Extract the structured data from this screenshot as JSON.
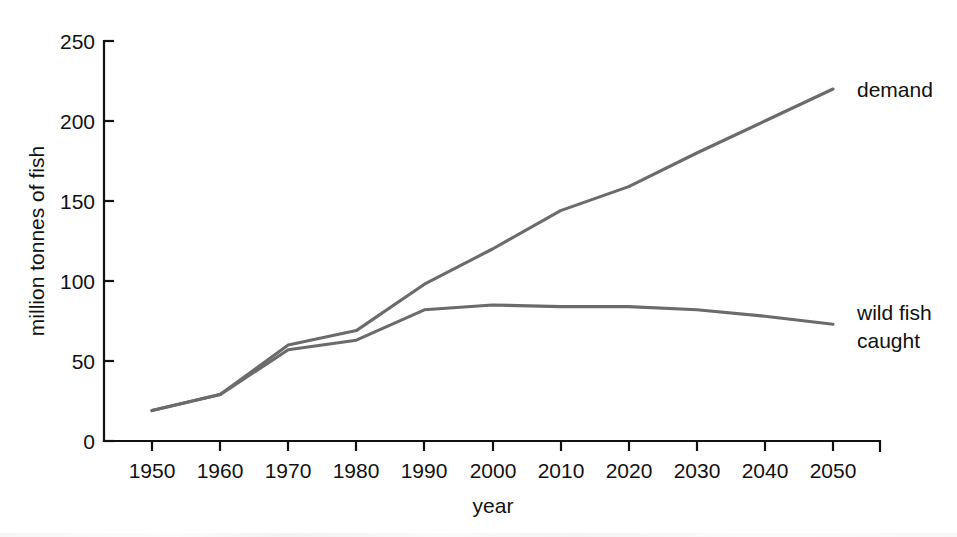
{
  "chart_data": {
    "type": "line",
    "title": "",
    "xlabel": "year",
    "ylabel": "million tonnes of fish",
    "xlim": [
      1945,
      2055
    ],
    "ylim": [
      0,
      250
    ],
    "xticks": [
      1950,
      1960,
      1970,
      1980,
      1990,
      2000,
      2010,
      2020,
      2030,
      2040,
      2050
    ],
    "yticks": [
      0,
      50,
      100,
      150,
      200,
      250
    ],
    "grid": false,
    "legend_position": "right-inline-labels",
    "line_color": "#6b6b6b",
    "axis_color": "#111111",
    "series": [
      {
        "name": "demand",
        "label": "demand",
        "x": [
          1950,
          1960,
          1970,
          1980,
          1990,
          2000,
          2010,
          2020,
          2030,
          2040,
          2050
        ],
        "values": [
          19,
          29,
          60,
          69,
          98,
          120,
          144,
          159,
          180,
          200,
          220
        ]
      },
      {
        "name": "wild fish caught",
        "label_lines": [
          "wild fish",
          "caught"
        ],
        "x": [
          1950,
          1960,
          1970,
          1980,
          1990,
          2000,
          2010,
          2020,
          2030,
          2040,
          2050
        ],
        "values": [
          19,
          29,
          57,
          63,
          82,
          85,
          84,
          84,
          82,
          78,
          73
        ]
      }
    ]
  },
  "axis": {
    "y_title": "million tonnes of fish",
    "x_title": "year",
    "y_tick_labels": [
      "250",
      "200",
      "150",
      "100",
      "50",
      "0"
    ],
    "x_tick_labels": [
      "1950",
      "1960",
      "1970",
      "1980",
      "1990",
      "2000",
      "2010",
      "2020",
      "2030",
      "2040",
      "2050"
    ]
  },
  "annotations": {
    "demand_label": "demand",
    "wild_fish_label_line1": "wild fish",
    "wild_fish_label_line2": "caught"
  }
}
